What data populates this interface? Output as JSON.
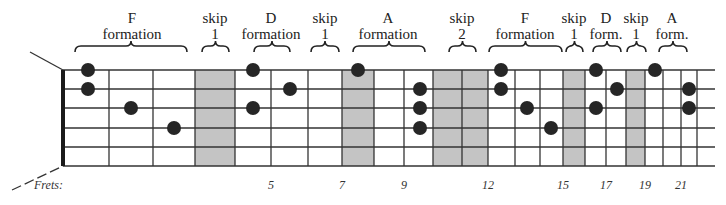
{
  "title": "",
  "diagram": {
    "nut_x": 63,
    "end_x": 715,
    "string_y": [
      70,
      89,
      108,
      128,
      147,
      166
    ],
    "fret_x": [
      109,
      153,
      195,
      235,
      271,
      308,
      342,
      374,
      404,
      433,
      462,
      488,
      515,
      540,
      563,
      585,
      606,
      626,
      645,
      663,
      681,
      697
    ],
    "shaded_frets": [
      4,
      8,
      11,
      12,
      16,
      19
    ],
    "dot_color": "#262626",
    "shade_color": "#c4c4c4"
  },
  "groups": [
    {
      "name": "F formation",
      "line1": "F",
      "line2": "formation",
      "x": 132,
      "brace_from": 75,
      "brace_to": 187
    },
    {
      "name": "skip 1",
      "line1": "skip",
      "line2": "1",
      "x": 215,
      "brace_from": 202,
      "brace_to": 229
    },
    {
      "name": "D formation",
      "line1": "D",
      "line2": "formation",
      "x": 271,
      "brace_from": 254,
      "brace_to": 290
    },
    {
      "name": "skip 1",
      "line1": "skip",
      "line2": "1",
      "x": 325,
      "brace_from": 311,
      "brace_to": 339
    },
    {
      "name": "A formation",
      "line1": "A",
      "line2": "formation",
      "x": 388,
      "brace_from": 353,
      "brace_to": 425
    },
    {
      "name": "skip 2",
      "line1": "skip",
      "line2": "2",
      "x": 462,
      "brace_from": 449,
      "brace_to": 476
    },
    {
      "name": "F formation",
      "line1": "F",
      "line2": "formation",
      "x": 525,
      "brace_from": 489,
      "brace_to": 562
    },
    {
      "name": "skip 1",
      "line1": "skip",
      "line2": "1",
      "x": 574,
      "brace_from": 566,
      "brace_to": 583
    },
    {
      "name": "D form.",
      "line1": "D",
      "line2": "form.",
      "x": 606,
      "brace_from": 593,
      "brace_to": 621
    },
    {
      "name": "skip 1",
      "line1": "skip",
      "line2": "1",
      "x": 636,
      "brace_from": 627,
      "brace_to": 646
    },
    {
      "name": "A form.",
      "line1": "A",
      "line2": "form.",
      "x": 672,
      "brace_from": 659,
      "brace_to": 687
    }
  ],
  "dots": [
    {
      "x": 88,
      "string": 1
    },
    {
      "x": 88,
      "string": 2
    },
    {
      "x": 131,
      "string": 3
    },
    {
      "x": 174,
      "string": 4
    },
    {
      "x": 253,
      "string": 1
    },
    {
      "x": 290,
      "string": 2
    },
    {
      "x": 253,
      "string": 3
    },
    {
      "x": 358,
      "string": 1
    },
    {
      "x": 420,
      "string": 2
    },
    {
      "x": 420,
      "string": 3
    },
    {
      "x": 420,
      "string": 4
    },
    {
      "x": 501,
      "string": 1
    },
    {
      "x": 501,
      "string": 2
    },
    {
      "x": 527,
      "string": 3
    },
    {
      "x": 551,
      "string": 4
    },
    {
      "x": 596,
      "string": 1
    },
    {
      "x": 617,
      "string": 2
    },
    {
      "x": 596,
      "string": 3
    },
    {
      "x": 655,
      "string": 1
    },
    {
      "x": 689,
      "string": 2
    },
    {
      "x": 689,
      "string": 3
    }
  ],
  "frets_label": "Frets:",
  "fret_numbers": [
    {
      "label": "5",
      "x": 271
    },
    {
      "label": "7",
      "x": 342
    },
    {
      "label": "9",
      "x": 404
    },
    {
      "label": "12",
      "x": 488
    },
    {
      "label": "15",
      "x": 563
    },
    {
      "label": "17",
      "x": 606
    },
    {
      "label": "19",
      "x": 645
    },
    {
      "label": "21",
      "x": 681
    }
  ]
}
